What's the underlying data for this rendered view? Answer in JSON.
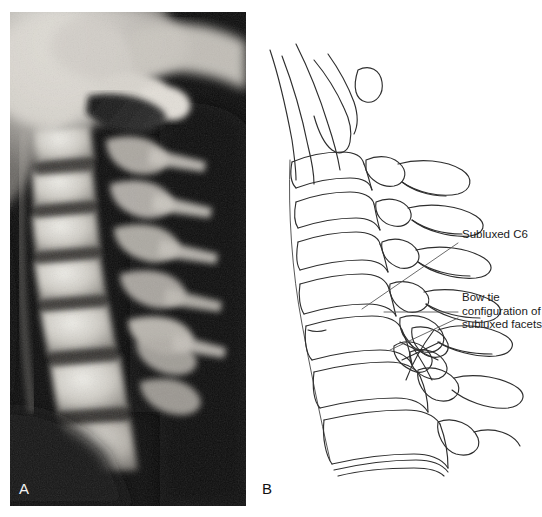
{
  "figure": {
    "type": "medical-figure",
    "background_color": "#ffffff"
  },
  "panels": [
    {
      "id": "A",
      "label": "A",
      "label_color": "#f2f2f2",
      "kind": "radiograph",
      "name": "lateral-cervical-spine-radiograph",
      "background_color": "#0a0a0a"
    },
    {
      "id": "B",
      "label": "B",
      "label_color": "#111111",
      "kind": "line-drawing",
      "name": "cervical-spine-line-drawing",
      "line_color": "#2a2a2a"
    }
  ],
  "annotations": [
    {
      "id": "subluxed-c6",
      "lines": [
        "Subluxed C6"
      ],
      "text": "Subluxed C6",
      "leader_color": "#5a5a5a"
    },
    {
      "id": "bow-tie",
      "lines": [
        "Bow tie",
        "configuration of",
        "subluxed facets"
      ],
      "text": "Bow tie\nconfiguration of\nsubluxed facets",
      "leader_color": "#5a5a5a"
    }
  ]
}
